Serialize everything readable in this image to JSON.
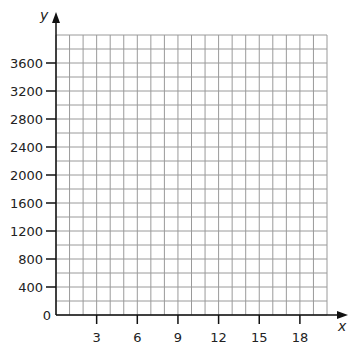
{
  "chart_data": {
    "type": "scatter",
    "title": "",
    "xlabel": "x",
    "ylabel": "y",
    "xlim": [
      0,
      20
    ],
    "ylim": [
      0,
      4000
    ],
    "grid": true,
    "grid_x_step": 1,
    "grid_y_step": 200,
    "x_ticks": [
      3,
      6,
      9,
      12,
      15,
      18
    ],
    "y_ticks": [
      0,
      400,
      800,
      1200,
      1600,
      2000,
      2400,
      2800,
      3200,
      3600
    ],
    "series": []
  },
  "labels": {
    "x_axis": "x",
    "y_axis": "y",
    "x_ticks": [
      "3",
      "6",
      "9",
      "12",
      "15",
      "18"
    ],
    "y_ticks": [
      "0",
      "400",
      "800",
      "1200",
      "1600",
      "2000",
      "2400",
      "2800",
      "3200",
      "3600"
    ]
  },
  "colors": {
    "grid": "#9a9a9a",
    "axis": "#111111",
    "text": "#222222"
  }
}
